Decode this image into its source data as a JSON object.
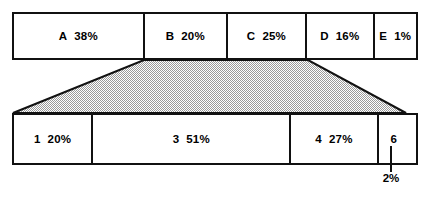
{
  "diagram": {
    "type": "proportional-bar-comparison",
    "shade_color": "#b8b8b8",
    "line_color": "#111111",
    "top_bar": {
      "total_percent": 100,
      "segments": [
        {
          "label": "A",
          "value": "38%",
          "percent": 38
        },
        {
          "label": "B",
          "value": "20%",
          "percent": 20
        },
        {
          "label": "C",
          "value": "25%",
          "percent": 25
        },
        {
          "label": "D",
          "value": "16%",
          "percent": 16
        },
        {
          "label": "E",
          "value": "1%",
          "percent": 1
        }
      ]
    },
    "bottom_bar": {
      "total_percent": 100,
      "segments": [
        {
          "label": "1",
          "value": "20%",
          "percent": 20
        },
        {
          "label": "3",
          "value": "51%",
          "percent": 51
        },
        {
          "label": "4",
          "value": "27%",
          "percent": 27
        },
        {
          "label": "6",
          "value": "",
          "percent": 2
        }
      ]
    },
    "annotation": {
      "text": "2%",
      "points_to_segment": "6"
    }
  }
}
